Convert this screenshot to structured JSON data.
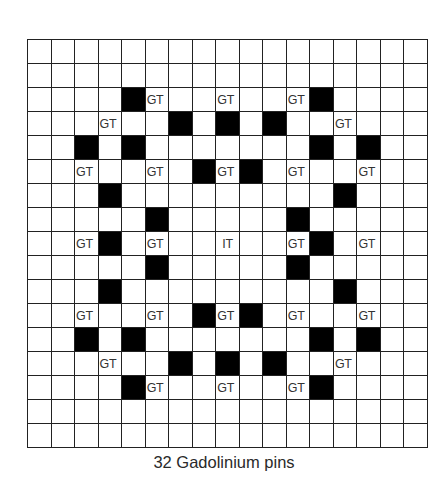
{
  "figure": {
    "caption": "32 Gadolinium pins",
    "grid": {
      "rows": 17,
      "cols": 17,
      "line_color": "#222222",
      "fill_color": "#000000"
    },
    "legend_labels": {
      "GT": "GT",
      "IT": "IT"
    },
    "black_cells": [
      [
        2,
        4
      ],
      [
        2,
        12
      ],
      [
        3,
        6
      ],
      [
        3,
        8
      ],
      [
        3,
        10
      ],
      [
        4,
        2
      ],
      [
        4,
        4
      ],
      [
        4,
        12
      ],
      [
        4,
        14
      ],
      [
        5,
        7
      ],
      [
        5,
        9
      ],
      [
        6,
        3
      ],
      [
        6,
        13
      ],
      [
        7,
        5
      ],
      [
        7,
        11
      ],
      [
        8,
        3
      ],
      [
        8,
        12
      ],
      [
        9,
        5
      ],
      [
        9,
        11
      ],
      [
        10,
        3
      ],
      [
        10,
        13
      ],
      [
        11,
        7
      ],
      [
        11,
        9
      ],
      [
        12,
        2
      ],
      [
        12,
        4
      ],
      [
        12,
        12
      ],
      [
        12,
        14
      ],
      [
        13,
        6
      ],
      [
        13,
        8
      ],
      [
        13,
        10
      ],
      [
        14,
        4
      ],
      [
        14,
        12
      ]
    ],
    "labeled_cells": [
      {
        "row": 2,
        "col": 5,
        "text": "GT"
      },
      {
        "row": 2,
        "col": 8,
        "text": "GT"
      },
      {
        "row": 2,
        "col": 11,
        "text": "GT"
      },
      {
        "row": 3,
        "col": 3,
        "text": "GT"
      },
      {
        "row": 3,
        "col": 13,
        "text": "GT"
      },
      {
        "row": 5,
        "col": 2,
        "text": "GT"
      },
      {
        "row": 5,
        "col": 5,
        "text": "GT"
      },
      {
        "row": 5,
        "col": 8,
        "text": "GT"
      },
      {
        "row": 5,
        "col": 11,
        "text": "GT"
      },
      {
        "row": 5,
        "col": 14,
        "text": "GT"
      },
      {
        "row": 8,
        "col": 2,
        "text": "GT"
      },
      {
        "row": 8,
        "col": 5,
        "text": "GT"
      },
      {
        "row": 8,
        "col": 8,
        "text": "IT"
      },
      {
        "row": 8,
        "col": 11,
        "text": "GT"
      },
      {
        "row": 8,
        "col": 14,
        "text": "GT"
      },
      {
        "row": 11,
        "col": 2,
        "text": "GT"
      },
      {
        "row": 11,
        "col": 5,
        "text": "GT"
      },
      {
        "row": 11,
        "col": 8,
        "text": "GT"
      },
      {
        "row": 11,
        "col": 11,
        "text": "GT"
      },
      {
        "row": 11,
        "col": 14,
        "text": "GT"
      },
      {
        "row": 13,
        "col": 3,
        "text": "GT"
      },
      {
        "row": 13,
        "col": 13,
        "text": "GT"
      },
      {
        "row": 14,
        "col": 5,
        "text": "GT"
      },
      {
        "row": 14,
        "col": 8,
        "text": "GT"
      },
      {
        "row": 14,
        "col": 11,
        "text": "GT"
      }
    ]
  }
}
